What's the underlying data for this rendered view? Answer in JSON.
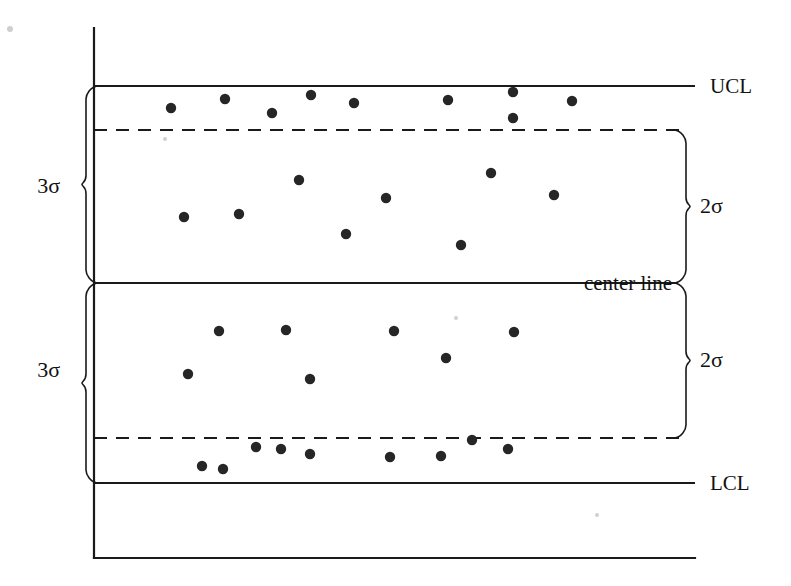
{
  "figure": {
    "kind": "statistical-process-control-chart",
    "background_color": "#ffffff",
    "ink_color": "#1a1a1a",
    "point_color": "#262626"
  },
  "labels": {
    "ucl": "UCL",
    "lcl": "LCL",
    "center_line": "center line",
    "sigma3_upper": "3σ",
    "sigma3_lower": "3σ",
    "sigma2_upper": "2σ",
    "sigma2_lower": "2σ"
  },
  "chart_data": {
    "type": "scatter",
    "title": "",
    "xlabel": "",
    "ylabel": "",
    "grid": false,
    "legend": "none",
    "xlim": [
      0,
      100
    ],
    "ylim": [
      0,
      100
    ],
    "axis": {
      "vertical_axis_x": 94,
      "vertical_axis_top_y": 28,
      "vertical_axis_bottom_y": 558,
      "horizontal_axis_y": 558,
      "horizontal_axis_right_x": 695
    },
    "reference_lines": [
      {
        "name": "UCL",
        "label": "UCL",
        "y_px": 86,
        "style": "solid",
        "x_start": 94,
        "x_end": 695
      },
      {
        "name": "upper_2sigma",
        "label": "",
        "y_px": 130,
        "style": "dashed",
        "x_start": 94,
        "x_end": 682
      },
      {
        "name": "center_line",
        "label": "center line",
        "y_px": 283,
        "style": "solid",
        "x_start": 94,
        "x_end": 678
      },
      {
        "name": "lower_2sigma",
        "label": "",
        "y_px": 438,
        "style": "dashed",
        "x_start": 94,
        "x_end": 682
      },
      {
        "name": "LCL",
        "label": "LCL",
        "y_px": 483,
        "style": "solid",
        "x_start": 94,
        "x_end": 695
      }
    ],
    "brackets": [
      {
        "name": "3sigma-upper",
        "label": "3σ",
        "side": "left",
        "from_y": 86,
        "to_y": 283,
        "tip_x": 86,
        "label_x": 60,
        "label_y": 193
      },
      {
        "name": "3sigma-lower",
        "label": "3σ",
        "side": "left",
        "from_y": 283,
        "to_y": 483,
        "tip_x": 86,
        "label_x": 60,
        "label_y": 377
      },
      {
        "name": "2sigma-upper",
        "label": "2σ",
        "side": "right",
        "from_y": 130,
        "to_y": 283,
        "tip_x": 686,
        "label_x": 700,
        "label_y": 213
      },
      {
        "name": "2sigma-lower",
        "label": "2σ",
        "side": "right",
        "from_y": 283,
        "to_y": 438,
        "tip_x": 686,
        "label_x": 700,
        "label_y": 367
      }
    ],
    "point_radius_px": 5.2,
    "points": [
      {
        "x_px": 171,
        "y_px": 108,
        "zone": "upper-A"
      },
      {
        "x_px": 225,
        "y_px": 99,
        "zone": "upper-A"
      },
      {
        "x_px": 272,
        "y_px": 113,
        "zone": "upper-A"
      },
      {
        "x_px": 311,
        "y_px": 95,
        "zone": "upper-A"
      },
      {
        "x_px": 354,
        "y_px": 103,
        "zone": "upper-A"
      },
      {
        "x_px": 448,
        "y_px": 100,
        "zone": "upper-A"
      },
      {
        "x_px": 513,
        "y_px": 92,
        "zone": "upper-A"
      },
      {
        "x_px": 513,
        "y_px": 118,
        "zone": "upper-A"
      },
      {
        "x_px": 572,
        "y_px": 101,
        "zone": "upper-A"
      },
      {
        "x_px": 184,
        "y_px": 217,
        "zone": "upper-B"
      },
      {
        "x_px": 239,
        "y_px": 214,
        "zone": "upper-B"
      },
      {
        "x_px": 299,
        "y_px": 180,
        "zone": "upper-B"
      },
      {
        "x_px": 346,
        "y_px": 234,
        "zone": "upper-B"
      },
      {
        "x_px": 386,
        "y_px": 198,
        "zone": "upper-B"
      },
      {
        "x_px": 461,
        "y_px": 245,
        "zone": "upper-B"
      },
      {
        "x_px": 491,
        "y_px": 173,
        "zone": "upper-B"
      },
      {
        "x_px": 554,
        "y_px": 195,
        "zone": "upper-B"
      },
      {
        "x_px": 188,
        "y_px": 374,
        "zone": "lower-B"
      },
      {
        "x_px": 219,
        "y_px": 331,
        "zone": "lower-B"
      },
      {
        "x_px": 286,
        "y_px": 330,
        "zone": "lower-B"
      },
      {
        "x_px": 310,
        "y_px": 379,
        "zone": "lower-B"
      },
      {
        "x_px": 394,
        "y_px": 331,
        "zone": "lower-B"
      },
      {
        "x_px": 446,
        "y_px": 358,
        "zone": "lower-B"
      },
      {
        "x_px": 514,
        "y_px": 332,
        "zone": "lower-B"
      },
      {
        "x_px": 202,
        "y_px": 466,
        "zone": "lower-A"
      },
      {
        "x_px": 223,
        "y_px": 469,
        "zone": "lower-A"
      },
      {
        "x_px": 256,
        "y_px": 447,
        "zone": "lower-A"
      },
      {
        "x_px": 281,
        "y_px": 449,
        "zone": "lower-A"
      },
      {
        "x_px": 310,
        "y_px": 454,
        "zone": "lower-A"
      },
      {
        "x_px": 390,
        "y_px": 457,
        "zone": "lower-A"
      },
      {
        "x_px": 441,
        "y_px": 456,
        "zone": "lower-A"
      },
      {
        "x_px": 472,
        "y_px": 440,
        "zone": "lower-A"
      },
      {
        "x_px": 508,
        "y_px": 449,
        "zone": "lower-A"
      }
    ]
  }
}
